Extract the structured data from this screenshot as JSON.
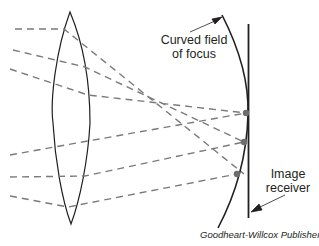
{
  "diagram": {
    "labels": {
      "curved_field": [
        "Curved field",
        "of focus"
      ],
      "image_receiver": [
        "Image",
        "receiver"
      ]
    },
    "credit": "Goodheart-Willcox Publisher",
    "colors": {
      "line": "#231f20",
      "ray": "#7a7a7a",
      "focal_point": "#6d6d6d",
      "background": "#ffffff"
    },
    "elements": {
      "lens": "convex-lens",
      "rays": 6,
      "focal_points": 3,
      "image_receiver": "flat vertical plane",
      "field_of_focus": "curved"
    }
  }
}
